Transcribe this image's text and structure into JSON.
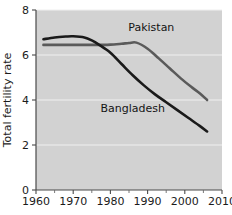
{
  "chart_data": {
    "type": "line",
    "title": "",
    "subtitle": "",
    "xlabel": "",
    "ylabel": "Total fertility rate",
    "xlim": [
      1960,
      2010
    ],
    "ylim": [
      0,
      8
    ],
    "grid": true,
    "grid_axis": "y",
    "legend_position": "inline-annotations",
    "background_color": "#d2d2d2",
    "x_ticks": [
      1960,
      1970,
      1980,
      1990,
      2000,
      2010
    ],
    "x_tick_labels": [
      "1960",
      "1970",
      "1980",
      "1990",
      "2000",
      "2010"
    ],
    "x_minor_ticks": [
      1965,
      1975,
      1985,
      1995,
      2005
    ],
    "y_ticks": [
      0,
      2,
      4,
      6,
      8
    ],
    "y_tick_labels": [
      "0",
      "2",
      "4",
      "6",
      "8"
    ],
    "series": [
      {
        "name": "Pakistan",
        "color": "#5a5a5a",
        "label_x": 1991,
        "label_y": 7.05,
        "x": [
          1962,
          1965,
          1970,
          1975,
          1978,
          1980,
          1983,
          1985,
          1987,
          1990,
          1993,
          1996,
          1999,
          2002,
          2004,
          2006
        ],
        "values": [
          6.45,
          6.45,
          6.45,
          6.45,
          6.45,
          6.46,
          6.5,
          6.53,
          6.55,
          6.28,
          5.85,
          5.4,
          4.95,
          4.55,
          4.3,
          4.0
        ]
      },
      {
        "name": "Bangladesh",
        "color": "#1a1a1a",
        "label_x": 1986,
        "label_y": 3.45,
        "x": [
          1962,
          1965,
          1968,
          1970,
          1973,
          1975,
          1977,
          1980,
          1983,
          1986,
          1989,
          1992,
          1995,
          1998,
          2001,
          2004,
          2006
        ],
        "values": [
          6.7,
          6.78,
          6.82,
          6.83,
          6.78,
          6.65,
          6.45,
          6.1,
          5.6,
          5.1,
          4.65,
          4.25,
          3.9,
          3.55,
          3.2,
          2.85,
          2.6
        ]
      }
    ]
  }
}
